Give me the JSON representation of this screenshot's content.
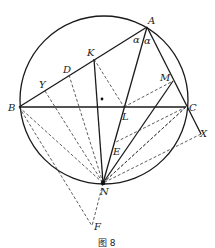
{
  "figure": {
    "caption": "图 8",
    "points": {
      "A": {
        "label": "A",
        "x": 147,
        "y": 27
      },
      "B": {
        "label": "B",
        "x": 19,
        "y": 107
      },
      "C": {
        "label": "C",
        "x": 186,
        "y": 107
      },
      "K": {
        "label": "K",
        "x": 94,
        "y": 59
      },
      "D": {
        "label": "D",
        "x": 69,
        "y": 75
      },
      "Y": {
        "label": "Y",
        "x": 45,
        "y": 91
      },
      "M": {
        "label": "M",
        "x": 173,
        "y": 81
      },
      "L": {
        "label": "L",
        "x": 124,
        "y": 107
      },
      "E": {
        "label": "E",
        "x": 114,
        "y": 143
      },
      "N": {
        "label": "N",
        "x": 103,
        "y": 183
      },
      "F": {
        "label": "F",
        "x": 92,
        "y": 226
      },
      "X": {
        "label": "X",
        "x": 201,
        "y": 134
      }
    },
    "angle_labels": [
      "α",
      "α"
    ],
    "circle": {
      "cx": 104,
      "cy": 100,
      "r": 84
    },
    "colors": {
      "line": "#1a1a1a",
      "background": "#ffffff"
    }
  }
}
